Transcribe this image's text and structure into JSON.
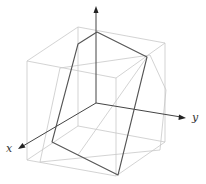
{
  "diagram": {
    "type": "3d-cube-section",
    "axes": {
      "x": {
        "label": "x"
      },
      "y": {
        "label": "y"
      },
      "z": {
        "label": ""
      }
    },
    "colors": {
      "cube_edges": "#c8c8c8",
      "section_polygon": "#555555",
      "axes": "#444444"
    }
  }
}
